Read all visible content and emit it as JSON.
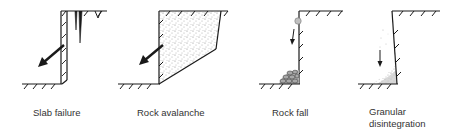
{
  "figure": {
    "panels": [
      {
        "id": "slab",
        "label": "Slab failure",
        "label_lines": [
          "Slab failure"
        ]
      },
      {
        "id": "avalanche",
        "label": "Rock avalanche",
        "label_lines": [
          "Rock avalanche"
        ]
      },
      {
        "id": "rockfall",
        "label": "Rock fall",
        "label_lines": [
          "Rock fall"
        ]
      },
      {
        "id": "granular",
        "label": "Granular disintegration",
        "label_lines": [
          "Granular",
          "disintegration"
        ]
      }
    ]
  },
  "colors": {
    "line": "#1a1a1a",
    "text": "#333333",
    "stipple": "#9a9a9a",
    "rock": "#b8b8b8"
  }
}
